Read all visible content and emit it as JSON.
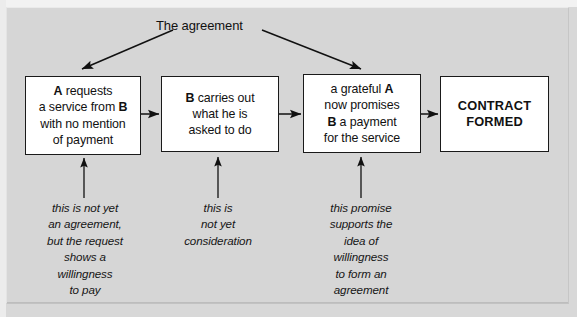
{
  "diagram": {
    "title_label": "The agreement",
    "background_color": "#d6d6d6",
    "box_fill": "#ffffff",
    "line_color": "#1a1a1a",
    "nodes": [
      {
        "id": "node-request",
        "lines": [
          "A requests",
          "a service from B",
          "with no mention",
          "of payment"
        ],
        "bold_tokens": [
          "A",
          "B"
        ],
        "style": "process"
      },
      {
        "id": "node-performance",
        "lines": [
          "B carries out",
          "what he is",
          "asked to do"
        ],
        "bold_tokens": [
          "B"
        ],
        "style": "process"
      },
      {
        "id": "node-promise",
        "lines": [
          "a grateful A",
          "now promises",
          "B a payment",
          "for the service"
        ],
        "bold_tokens": [
          "A",
          "B"
        ],
        "style": "process"
      },
      {
        "id": "node-contract",
        "lines": [
          "CONTRACT",
          "FORMED"
        ],
        "bold_tokens": [],
        "style": "terminal"
      }
    ],
    "captions": [
      {
        "id": "caption-request",
        "text": "this is not yet\nan agreement,\nbut the request\nshows a\nwillingness\nto pay"
      },
      {
        "id": "caption-performance",
        "text": "this is\nnot yet\nconsideration"
      },
      {
        "id": "caption-promise",
        "text": "this promise\nsupports the\nidea of\nwillingness\nto form an\nagreement"
      }
    ]
  }
}
